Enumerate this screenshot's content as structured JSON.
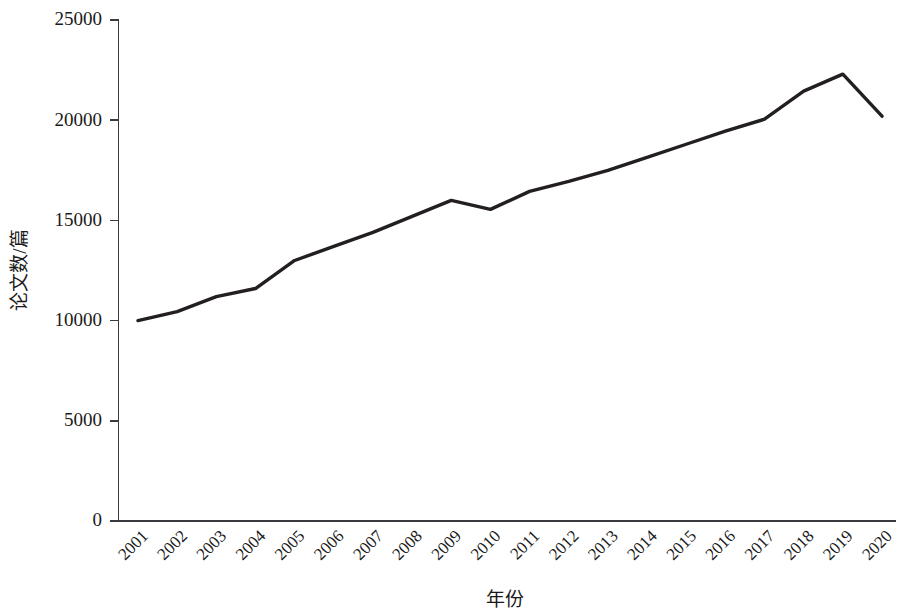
{
  "chart_data": {
    "type": "line",
    "title": "",
    "xlabel": "年份",
    "ylabel": "论文数/篇",
    "x": [
      "2001",
      "2002",
      "2003",
      "2004",
      "2005",
      "2006",
      "2007",
      "2008",
      "2009",
      "2010",
      "2011",
      "2012",
      "2013",
      "2014",
      "2015",
      "2016",
      "2017",
      "2018",
      "2019",
      "2020"
    ],
    "values": [
      10000,
      10450,
      11200,
      11600,
      13000,
      13700,
      14400,
      15200,
      16000,
      15550,
      16450,
      16950,
      17500,
      18150,
      18800,
      19450,
      20050,
      21450,
      22300,
      20200
    ],
    "series": [
      {
        "name": "论文数",
        "color": "#231f20",
        "values": [
          10000,
          10450,
          11200,
          11600,
          13000,
          13700,
          14400,
          15200,
          16000,
          15550,
          16450,
          16950,
          17500,
          18150,
          18800,
          19450,
          20050,
          21450,
          22300,
          20200
        ]
      }
    ],
    "ylim": [
      0,
      25000
    ],
    "yticks": [
      0,
      5000,
      10000,
      15000,
      20000,
      25000
    ],
    "ytick_labels": [
      "0",
      "5000",
      "10000",
      "15000",
      "20000",
      "25000"
    ],
    "xtick_labels": [
      "2001",
      "2002",
      "2003",
      "2004",
      "2005",
      "2006",
      "2007",
      "2008",
      "2009",
      "2010",
      "2011",
      "2012",
      "2013",
      "2014",
      "2015",
      "2016",
      "2017",
      "2018",
      "2019",
      "2020"
    ],
    "xtick_rotation": -45,
    "grid": false,
    "legend": false,
    "legend_position": "none",
    "line_color": "#231f20",
    "axis_color": "#3b3b3f",
    "background_color": "#ffffff"
  },
  "axis": {
    "y_title": "论文数/篇",
    "x_title": "年份"
  }
}
